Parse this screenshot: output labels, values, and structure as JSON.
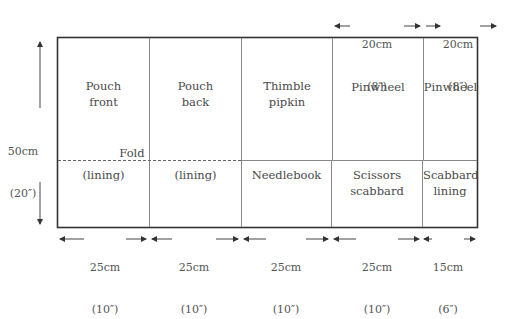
{
  "diagram": {
    "pieces": [
      {
        "id": "pouch-front",
        "label_line1": "Pouch",
        "label_line2": "front"
      },
      {
        "id": "pouch-back",
        "label_line1": "Pouch",
        "label_line2": "back"
      },
      {
        "id": "thimble-pipkin",
        "label_line1": "Thimble",
        "label_line2": "pipkin"
      },
      {
        "id": "pinwheel-1",
        "label_line1": "Pinwheel",
        "label_line2": ""
      },
      {
        "id": "pinwheel-2",
        "label_line1": "Pinwheel",
        "label_line2": ""
      },
      {
        "id": "lining-1",
        "label_line1": "(lining)",
        "label_line2": ""
      },
      {
        "id": "lining-2",
        "label_line1": "(lining)",
        "label_line2": ""
      },
      {
        "id": "needlebook",
        "label_line1": "Needlebook",
        "label_line2": ""
      },
      {
        "id": "scissors-scabbard",
        "label_line1": "Scissors",
        "label_line2": "scabbard"
      },
      {
        "id": "scabbard-lining",
        "label_line1": "Scabbard",
        "label_line2": "lining"
      }
    ],
    "fold_label": "Fold",
    "height_dimension": {
      "cm": "50cm",
      "in": "(20″)"
    },
    "top_dimensions": [
      {
        "cm": "20cm",
        "in": "(8″)"
      },
      {
        "cm": "20cm",
        "in": "(8″)"
      }
    ],
    "bottom_dimensions": [
      {
        "cm": "25cm",
        "in": "(10″)"
      },
      {
        "cm": "25cm",
        "in": "(10″)"
      },
      {
        "cm": "25cm",
        "in": "(10″)"
      },
      {
        "cm": "25cm",
        "in": "(10″)"
      },
      {
        "cm": "15cm",
        "in": "(6″)"
      }
    ],
    "colors": {
      "outline": "#333333",
      "divider": "#777777",
      "text": "#4a4a4a"
    }
  }
}
